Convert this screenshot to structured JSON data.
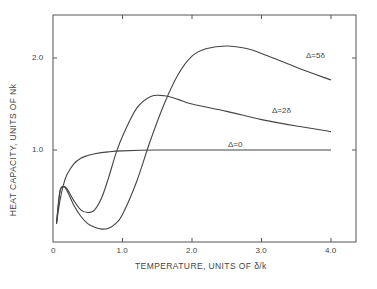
{
  "chart_data": {
    "type": "line",
    "title": "",
    "xlabel": "TEMPERATURE, UNITS OF δ/k",
    "ylabel": "HEAT CAPACITY, UNITS OF Nk",
    "xlim": [
      0,
      4.35
    ],
    "ylim": [
      0,
      2.45
    ],
    "xticks": [
      0,
      1.0,
      2.0,
      3.0,
      4.0
    ],
    "xtick_labels": [
      "0",
      "1.0",
      "2.0",
      "3.0",
      "4.0"
    ],
    "yticks": [
      1.0,
      2.0
    ],
    "ytick_labels": [
      "1.0",
      "2.0"
    ],
    "grid": false,
    "legend": "inline curve labels",
    "series": [
      {
        "name": "Δ=0",
        "label_text": "Δ=0",
        "x": [
          0.05,
          0.1,
          0.15,
          0.2,
          0.3,
          0.4,
          0.5,
          0.6,
          0.8,
          1.0,
          1.5,
          2.0,
          3.0,
          4.0
        ],
        "y": [
          0.2,
          0.45,
          0.62,
          0.73,
          0.85,
          0.91,
          0.94,
          0.96,
          0.98,
          0.99,
          1.0,
          1.0,
          1.0,
          1.0
        ]
      },
      {
        "name": "Δ=2δ",
        "label_text": "Δ=2δ",
        "x": [
          0.05,
          0.1,
          0.15,
          0.2,
          0.3,
          0.4,
          0.5,
          0.6,
          0.7,
          0.8,
          0.9,
          1.0,
          1.2,
          1.4,
          1.6,
          1.8,
          2.0,
          2.5,
          3.0,
          3.5,
          4.0
        ],
        "y": [
          0.2,
          0.55,
          0.6,
          0.58,
          0.45,
          0.35,
          0.32,
          0.35,
          0.48,
          0.7,
          0.95,
          1.15,
          1.45,
          1.58,
          1.59,
          1.55,
          1.5,
          1.42,
          1.33,
          1.26,
          1.2
        ]
      },
      {
        "name": "Δ=5δ",
        "label_text": "Δ=5δ",
        "x": [
          0.05,
          0.1,
          0.15,
          0.2,
          0.3,
          0.4,
          0.5,
          0.6,
          0.7,
          0.8,
          0.9,
          1.0,
          1.2,
          1.4,
          1.6,
          1.8,
          2.0,
          2.2,
          2.5,
          2.8,
          3.0,
          3.5,
          4.0
        ],
        "y": [
          0.2,
          0.55,
          0.6,
          0.56,
          0.4,
          0.28,
          0.2,
          0.16,
          0.14,
          0.15,
          0.2,
          0.3,
          0.65,
          1.1,
          1.5,
          1.82,
          2.02,
          2.1,
          2.13,
          2.1,
          2.05,
          1.9,
          1.76
        ]
      }
    ]
  },
  "axes": {
    "xlabel": "TEMPERATURE, UNITS OF δ/k",
    "ylabel": "HEAT CAPACITY, UNITS OF Nk"
  }
}
